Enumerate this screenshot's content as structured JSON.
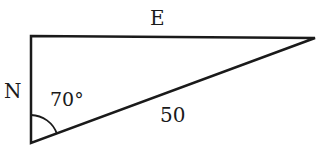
{
  "diagram": {
    "type": "right-triangle",
    "labels": {
      "top_side": "E",
      "left_side": "N",
      "angle": "70°",
      "hypotenuse": "50"
    },
    "angle_degrees": 70,
    "hypotenuse_length": 50,
    "stroke_color": "#1a1a1a"
  }
}
